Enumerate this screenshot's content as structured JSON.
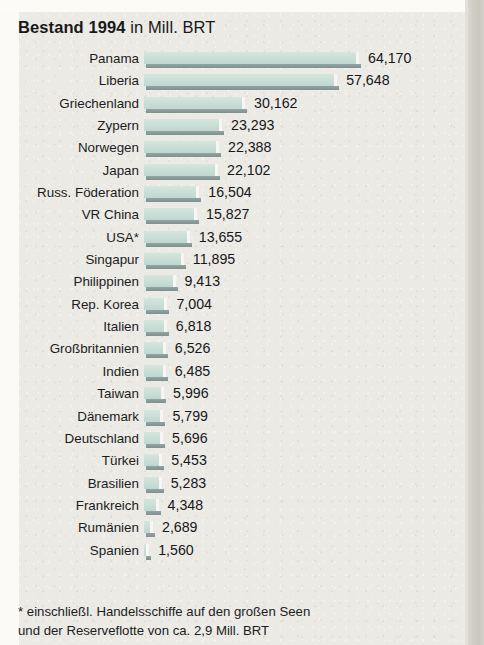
{
  "title": {
    "bold_part": "Bestand 1994",
    "normal_part": " in Mill. BRT"
  },
  "footnote": {
    "line1": "* einschließl. Handelsschiffe auf den großen Seen",
    "line2": "und der Reserveflotte von ca. 2,9 Mill. BRT"
  },
  "colors": {
    "bar_fill": "#cbe0d9",
    "bar_shadow": "#8b9b9b",
    "panel_background": "#eceae4",
    "text": "#17181a"
  },
  "chart_data": {
    "type": "bar",
    "title": "Bestand 1994 in Mill. BRT",
    "orientation": "horizontal",
    "xlabel": "",
    "ylabel": "",
    "unit": "1000 BRT",
    "grid": false,
    "legend": "none",
    "xlim": [
      0,
      64170
    ],
    "categories": [
      "Panama",
      "Liberia",
      "Griechenland",
      "Zypern",
      "Norwegen",
      "Japan",
      "Russ. Föderation",
      "VR China",
      "USA*",
      "Singapur",
      "Philippinen",
      "Rep. Korea",
      "Italien",
      "Großbritannien",
      "Indien",
      "Taiwan",
      "Dänemark",
      "Deutschland",
      "Türkei",
      "Brasilien",
      "Frankreich",
      "Rumänien",
      "Spanien"
    ],
    "values": [
      64170,
      57648,
      30162,
      23293,
      22388,
      22102,
      16504,
      15827,
      13655,
      11895,
      9413,
      7004,
      6818,
      6526,
      6485,
      5996,
      5799,
      5696,
      5453,
      5283,
      4348,
      2689,
      1560
    ],
    "value_labels": [
      "64,170",
      "57,648",
      "30,162",
      "23,293",
      "22,388",
      "22,102",
      "16,504",
      "15,827",
      "13,655",
      "11,895",
      "9,413",
      "7,004",
      "6,818",
      "6,526",
      "6,485",
      "5,996",
      "5,799",
      "5,696",
      "5,453",
      "5,283",
      "4,348",
      "2,689",
      "1,560"
    ],
    "annotations": [
      "* einschließl. Handelsschiffe auf den großen Seen und der Reserveflotte von ca. 2,9 Mill. BRT"
    ]
  }
}
